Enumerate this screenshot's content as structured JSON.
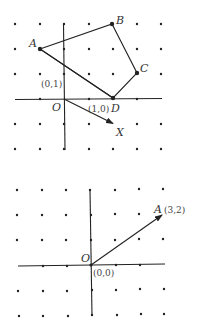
{
  "colors": {
    "ink": "#222222",
    "background": "#ffffff"
  },
  "figures": [
    {
      "name": "polygon-figure",
      "origin_label": "O",
      "unit_x_label": "(1,0)",
      "unit_y_label": "(0,1)",
      "points": [
        {
          "label": "A",
          "coord": [
            -1,
            2
          ]
        },
        {
          "label": "B",
          "coord": [
            2,
            3
          ]
        },
        {
          "label": "C",
          "coord": [
            3,
            1
          ]
        },
        {
          "label": "D",
          "coord": [
            2,
            0
          ]
        },
        {
          "label": "X",
          "coord": [
            2,
            -1
          ]
        }
      ],
      "polygon": [
        "A",
        "B",
        "C",
        "D"
      ],
      "vector": {
        "from": "O",
        "to": "X"
      }
    },
    {
      "name": "vector-figure",
      "origin_label": "O",
      "origin_coord_label": "(0,0)",
      "point": {
        "label": "A",
        "coord_label": "(3,2)",
        "coord": [
          3,
          2
        ]
      },
      "vector": {
        "from": "O",
        "to": "A"
      }
    }
  ]
}
